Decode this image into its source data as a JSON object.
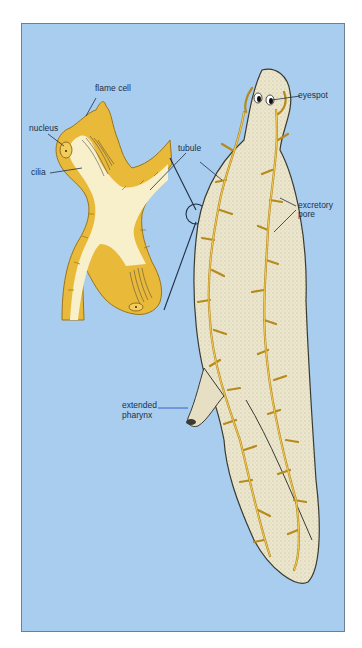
{
  "figure": {
    "colors": {
      "background": "#a9cdee",
      "frame_border": "#6d7f92",
      "tubule": "#e9b93a",
      "tubule_outline": "#7a5a14",
      "body": "#ece6cc",
      "lumen": "#f8efcb",
      "leader_line": "#1f2f44",
      "pharynx_leader": "#2e56c4"
    },
    "labels": {
      "flame_cell": "flame cell",
      "nucleus": "nucleus",
      "cilia": "cilia",
      "tubule": "tubule",
      "eyespot": "eyespot",
      "excretory_pore_1": "excretory",
      "excretory_pore_2": "pore",
      "extended_pharynx_1": "extended",
      "extended_pharynx_2": "pharynx"
    }
  }
}
